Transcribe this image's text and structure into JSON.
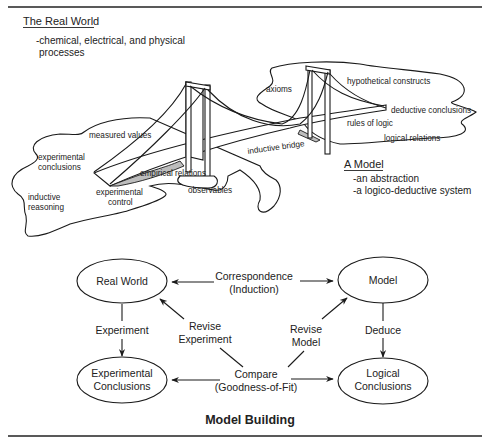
{
  "real_world": {
    "heading": "The Real World",
    "description_line1": "-chemical, electrical, and physical",
    "description_line2": "processes"
  },
  "model": {
    "heading": "A Model",
    "description_line1": "-an abstraction",
    "description_line2": "-a logico-deductive system"
  },
  "bridge_labels": {
    "axioms": "axioms",
    "hypothetical_constructs": "hypothetical constructs",
    "deductive_conclusions": "deductive conclusions",
    "rules_of_logic": "rules of logic",
    "logical_relations": "logical relations",
    "inductive_bridge": "inductive bridge",
    "measured_values": "measured values",
    "experimental_conclusions_1": "experimental",
    "experimental_conclusions_2": "conclusions",
    "empirical_relations": "empirical relations",
    "observables": "observables",
    "inductive_reasoning_1": "inductive",
    "inductive_reasoning_2": "reasoning",
    "experimental_control_1": "experimental",
    "experimental_control_2": "control"
  },
  "flow": {
    "title": "Model Building",
    "nodes": {
      "real_world": "Real World",
      "model": "Model",
      "experimental_conclusions_1": "Experimental",
      "experimental_conclusions_2": "Conclusions",
      "logical_conclusions_1": "Logical",
      "logical_conclusions_2": "Conclusions"
    },
    "edges": {
      "correspondence_1": "Correspondence",
      "correspondence_2": "(Induction)",
      "experiment": "Experiment",
      "deduce": "Deduce",
      "revise_experiment_1": "Revise",
      "revise_experiment_2": "Experiment",
      "revise_model_1": "Revise",
      "revise_model_2": "Model",
      "compare_1": "Compare",
      "compare_2": "(Goodness-of-Fit)"
    }
  }
}
